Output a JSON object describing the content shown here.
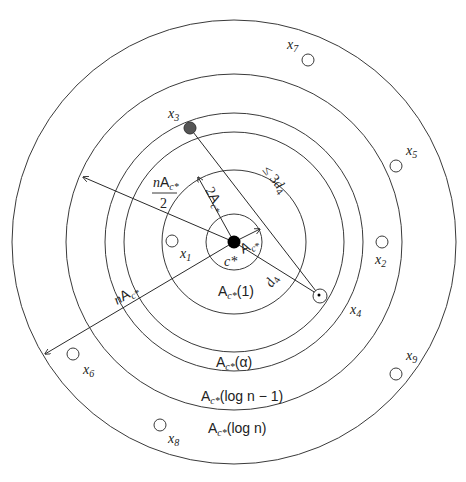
{
  "diagram": {
    "center": {
      "label": "c*",
      "x": 234,
      "y": 242
    },
    "rings": [
      {
        "r": 28,
        "label": ""
      },
      {
        "r": 72,
        "label": "A_c*(1)"
      },
      {
        "r": 110,
        "label": ""
      },
      {
        "r": 129,
        "label": "A_c*(α)"
      },
      {
        "r": 168,
        "label": "A_c*(log n − 1)"
      },
      {
        "r": 222,
        "label": "A_c*(log n)"
      }
    ],
    "ring_labels": {
      "r1": "(1)",
      "r_alpha": "(α)",
      "r_logn_minus_1": "(log n − 1)",
      "r_logn": "(log n)",
      "A": "A",
      "c_star": "c*"
    },
    "points": [
      {
        "name": "x1",
        "label": "x",
        "sub": "1"
      },
      {
        "name": "x2",
        "label": "x",
        "sub": "2"
      },
      {
        "name": "x3",
        "label": "x",
        "sub": "3"
      },
      {
        "name": "x4",
        "label": "x",
        "sub": "4"
      },
      {
        "name": "x5",
        "label": "x",
        "sub": "5"
      },
      {
        "name": "x6",
        "label": "x",
        "sub": "6"
      },
      {
        "name": "x7",
        "label": "x",
        "sub": "7"
      },
      {
        "name": "x8",
        "label": "x",
        "sub": "8"
      },
      {
        "name": "x9",
        "label": "x",
        "sub": "9"
      }
    ],
    "measures": {
      "inner_radius": "A_c*",
      "second_radius": "2A_c*",
      "half_radius": "nA_c*/2",
      "outer_radius": "nA_c*",
      "distance_d4": "d*_4",
      "bound": "≤ 3d*_4",
      "n": "n",
      "two": "2",
      "three": "3",
      "d": "d",
      "le": "≤"
    },
    "colors": {
      "stroke": "#3a3a3a",
      "center_fill": "#000000",
      "x3_fill": "#555555"
    }
  }
}
